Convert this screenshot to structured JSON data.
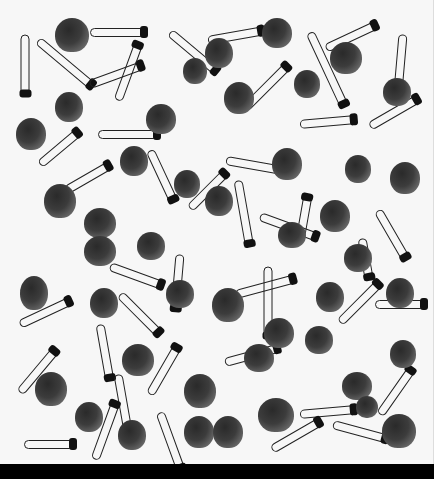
{
  "image": {
    "description": "Black-and-white photograph of scattered safety pins and small clam shells on a white background",
    "background_color": "#f7f7f7",
    "bottom_band_color": "#000000",
    "shells": [
      {
        "x": 55,
        "y": 18,
        "w": 34,
        "h": 34
      },
      {
        "x": 262,
        "y": 18,
        "w": 30,
        "h": 30
      },
      {
        "x": 330,
        "y": 42,
        "w": 32,
        "h": 32
      },
      {
        "x": 205,
        "y": 38,
        "w": 28,
        "h": 30
      },
      {
        "x": 183,
        "y": 58,
        "w": 24,
        "h": 26
      },
      {
        "x": 55,
        "y": 92,
        "w": 28,
        "h": 30
      },
      {
        "x": 224,
        "y": 82,
        "w": 30,
        "h": 32
      },
      {
        "x": 146,
        "y": 104,
        "w": 30,
        "h": 30
      },
      {
        "x": 294,
        "y": 70,
        "w": 26,
        "h": 28
      },
      {
        "x": 383,
        "y": 78,
        "w": 28,
        "h": 28
      },
      {
        "x": 16,
        "y": 118,
        "w": 30,
        "h": 32
      },
      {
        "x": 120,
        "y": 146,
        "w": 28,
        "h": 30
      },
      {
        "x": 272,
        "y": 148,
        "w": 30,
        "h": 32
      },
      {
        "x": 345,
        "y": 155,
        "w": 26,
        "h": 28
      },
      {
        "x": 390,
        "y": 162,
        "w": 30,
        "h": 32
      },
      {
        "x": 44,
        "y": 184,
        "w": 32,
        "h": 34
      },
      {
        "x": 174,
        "y": 170,
        "w": 26,
        "h": 28
      },
      {
        "x": 205,
        "y": 186,
        "w": 28,
        "h": 30
      },
      {
        "x": 84,
        "y": 208,
        "w": 32,
        "h": 30
      },
      {
        "x": 84,
        "y": 236,
        "w": 32,
        "h": 30
      },
      {
        "x": 137,
        "y": 232,
        "w": 28,
        "h": 28
      },
      {
        "x": 278,
        "y": 222,
        "w": 28,
        "h": 26
      },
      {
        "x": 320,
        "y": 200,
        "w": 30,
        "h": 32
      },
      {
        "x": 344,
        "y": 244,
        "w": 28,
        "h": 28
      },
      {
        "x": 20,
        "y": 276,
        "w": 28,
        "h": 34
      },
      {
        "x": 90,
        "y": 288,
        "w": 28,
        "h": 30
      },
      {
        "x": 166,
        "y": 280,
        "w": 28,
        "h": 28
      },
      {
        "x": 212,
        "y": 288,
        "w": 32,
        "h": 34
      },
      {
        "x": 316,
        "y": 282,
        "w": 28,
        "h": 30
      },
      {
        "x": 386,
        "y": 278,
        "w": 28,
        "h": 30
      },
      {
        "x": 264,
        "y": 318,
        "w": 30,
        "h": 30
      },
      {
        "x": 305,
        "y": 326,
        "w": 28,
        "h": 28
      },
      {
        "x": 122,
        "y": 344,
        "w": 32,
        "h": 32
      },
      {
        "x": 244,
        "y": 344,
        "w": 30,
        "h": 28
      },
      {
        "x": 390,
        "y": 340,
        "w": 26,
        "h": 28
      },
      {
        "x": 35,
        "y": 372,
        "w": 32,
        "h": 34
      },
      {
        "x": 184,
        "y": 374,
        "w": 32,
        "h": 34
      },
      {
        "x": 342,
        "y": 372,
        "w": 30,
        "h": 28
      },
      {
        "x": 75,
        "y": 402,
        "w": 28,
        "h": 30
      },
      {
        "x": 118,
        "y": 420,
        "w": 28,
        "h": 30
      },
      {
        "x": 184,
        "y": 416,
        "w": 30,
        "h": 32
      },
      {
        "x": 213,
        "y": 416,
        "w": 30,
        "h": 32
      },
      {
        "x": 258,
        "y": 398,
        "w": 36,
        "h": 34
      },
      {
        "x": 382,
        "y": 414,
        "w": 34,
        "h": 34
      },
      {
        "x": 356,
        "y": 396,
        "w": 22,
        "h": 22
      }
    ],
    "pins": [
      {
        "x": 25,
        "y": 30,
        "len": 60,
        "rot": 90
      },
      {
        "x": 38,
        "y": 36,
        "len": 70,
        "rot": 40
      },
      {
        "x": 90,
        "y": 28,
        "len": 55,
        "rot": 0
      },
      {
        "x": 170,
        "y": 28,
        "len": 60,
        "rot": 40
      },
      {
        "x": 208,
        "y": 36,
        "len": 55,
        "rot": -10
      },
      {
        "x": 310,
        "y": 28,
        "len": 80,
        "rot": 65
      },
      {
        "x": 326,
        "y": 44,
        "len": 55,
        "rot": -25
      },
      {
        "x": 403,
        "y": 30,
        "len": 55,
        "rot": 95
      },
      {
        "x": 90,
        "y": 80,
        "len": 55,
        "rot": -20
      },
      {
        "x": 118,
        "y": 96,
        "len": 60,
        "rot": -70
      },
      {
        "x": 245,
        "y": 104,
        "len": 60,
        "rot": -45
      },
      {
        "x": 300,
        "y": 120,
        "len": 55,
        "rot": -5
      },
      {
        "x": 40,
        "y": 160,
        "len": 50,
        "rot": -40
      },
      {
        "x": 98,
        "y": 130,
        "len": 60,
        "rot": 0
      },
      {
        "x": 150,
        "y": 146,
        "len": 55,
        "rot": 65
      },
      {
        "x": 226,
        "y": 156,
        "len": 55,
        "rot": 10
      },
      {
        "x": 238,
        "y": 176,
        "len": 65,
        "rot": 80
      },
      {
        "x": 370,
        "y": 122,
        "len": 55,
        "rot": -30
      },
      {
        "x": 66,
        "y": 186,
        "len": 50,
        "rot": -30
      },
      {
        "x": 190,
        "y": 204,
        "len": 50,
        "rot": -45
      },
      {
        "x": 260,
        "y": 212,
        "len": 60,
        "rot": 20
      },
      {
        "x": 300,
        "y": 236,
        "len": 45,
        "rot": -80
      },
      {
        "x": 378,
        "y": 206,
        "len": 55,
        "rot": 60
      },
      {
        "x": 362,
        "y": 234,
        "len": 40,
        "rot": 80
      },
      {
        "x": 20,
        "y": 320,
        "len": 55,
        "rot": -25
      },
      {
        "x": 110,
        "y": 262,
        "len": 55,
        "rot": 20
      },
      {
        "x": 120,
        "y": 290,
        "len": 55,
        "rot": 45
      },
      {
        "x": 180,
        "y": 250,
        "len": 55,
        "rot": 95
      },
      {
        "x": 236,
        "y": 290,
        "len": 60,
        "rot": -15
      },
      {
        "x": 268,
        "y": 262,
        "len": 70,
        "rot": 90
      },
      {
        "x": 340,
        "y": 318,
        "len": 55,
        "rot": -45
      },
      {
        "x": 375,
        "y": 300,
        "len": 50,
        "rot": 0
      },
      {
        "x": 20,
        "y": 388,
        "len": 55,
        "rot": -50
      },
      {
        "x": 100,
        "y": 320,
        "len": 55,
        "rot": 80
      },
      {
        "x": 150,
        "y": 390,
        "len": 55,
        "rot": -60
      },
      {
        "x": 118,
        "y": 370,
        "len": 55,
        "rot": 80
      },
      {
        "x": 225,
        "y": 358,
        "len": 55,
        "rot": -15
      },
      {
        "x": 300,
        "y": 410,
        "len": 55,
        "rot": -5
      },
      {
        "x": 272,
        "y": 445,
        "len": 55,
        "rot": -30
      },
      {
        "x": 333,
        "y": 420,
        "len": 55,
        "rot": 15
      },
      {
        "x": 380,
        "y": 410,
        "len": 55,
        "rot": -55
      },
      {
        "x": 24,
        "y": 440,
        "len": 50,
        "rot": 0
      },
      {
        "x": 95,
        "y": 455,
        "len": 60,
        "rot": -70
      },
      {
        "x": 160,
        "y": 408,
        "len": 60,
        "rot": 70
      }
    ]
  }
}
